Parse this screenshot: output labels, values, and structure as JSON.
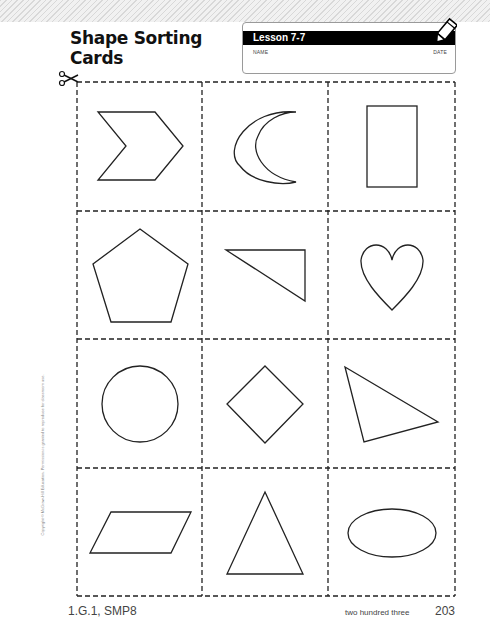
{
  "header": {
    "title_line1": "Shape Sorting",
    "title_line2": "Cards",
    "lesson": "Lesson 7-7",
    "name_label": "NAME",
    "date_label": "DATE"
  },
  "icons": {
    "pencil": "pencil-icon",
    "scissors": "scissors-icon"
  },
  "cards": [
    {
      "row": 0,
      "col": 0,
      "shape": "chevron"
    },
    {
      "row": 0,
      "col": 1,
      "shape": "crescent"
    },
    {
      "row": 0,
      "col": 2,
      "shape": "rectangle"
    },
    {
      "row": 1,
      "col": 0,
      "shape": "pentagon"
    },
    {
      "row": 1,
      "col": 1,
      "shape": "right-triangle"
    },
    {
      "row": 1,
      "col": 2,
      "shape": "heart"
    },
    {
      "row": 2,
      "col": 0,
      "shape": "circle"
    },
    {
      "row": 2,
      "col": 1,
      "shape": "square-rhombus"
    },
    {
      "row": 2,
      "col": 2,
      "shape": "scalene-triangle"
    },
    {
      "row": 3,
      "col": 0,
      "shape": "parallelogram"
    },
    {
      "row": 3,
      "col": 1,
      "shape": "isosceles-triangle"
    },
    {
      "row": 3,
      "col": 2,
      "shape": "oval"
    }
  ],
  "footer": {
    "standards": "1.G.1, SMP8",
    "page_words": "two hundred three",
    "page_number": "203"
  },
  "copyright": "Copyright © McGraw-Hill Education. Permission is granted to reproduce for classroom use."
}
